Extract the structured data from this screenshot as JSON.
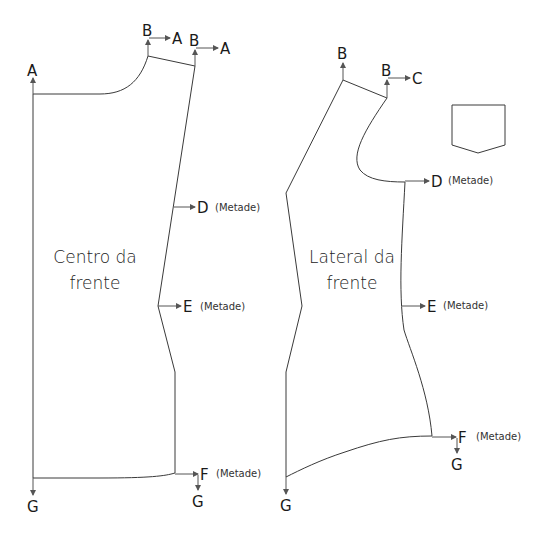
{
  "diagram": {
    "type": "sewing-pattern",
    "pieces": [
      {
        "id": "centro-da-frente",
        "name_line1": "Centro da",
        "name_line2": "frente",
        "points": [
          {
            "label": "A",
            "note": ""
          },
          {
            "label": "B",
            "note": "",
            "arrow_to": "A"
          },
          {
            "label": "B",
            "note": "",
            "arrow_to": "A"
          },
          {
            "label": "D",
            "note": "(Metade)"
          },
          {
            "label": "E",
            "note": "(Metade)"
          },
          {
            "label": "F",
            "note": "(Metade)"
          },
          {
            "label": "G",
            "note": ""
          },
          {
            "label": "G",
            "note": ""
          }
        ]
      },
      {
        "id": "lateral-da-frente",
        "name_line1": "Lateral da",
        "name_line2": "frente",
        "points": [
          {
            "label": "B",
            "note": ""
          },
          {
            "label": "B",
            "note": "",
            "arrow_to": "C"
          },
          {
            "label": "D",
            "note": "(Metade)"
          },
          {
            "label": "E",
            "note": "(Metade)"
          },
          {
            "label": "F",
            "note": "(Metade)"
          },
          {
            "label": "G",
            "note": ""
          },
          {
            "label": "G",
            "note": ""
          }
        ]
      },
      {
        "id": "bolso",
        "shape": "pocket"
      }
    ]
  }
}
